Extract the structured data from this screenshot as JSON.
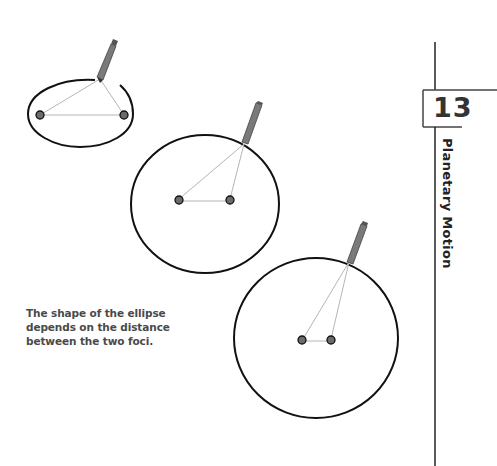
{
  "chapter": {
    "number": "13",
    "title": "Planetary Motion"
  },
  "caption": {
    "text": "The shape of the ellipse depends on the distance between the two foci."
  },
  "figure": {
    "ellipses": [
      {
        "cx": 80,
        "cy": 114,
        "rx": 53,
        "ry": 33,
        "foci": [
          [
            40,
            115
          ],
          [
            124,
            115
          ]
        ],
        "pencil_tip": [
          100,
          79
        ]
      },
      {
        "cx": 205,
        "cy": 200,
        "rx": 75,
        "ry": 70,
        "foci": [
          [
            179,
            199
          ],
          [
            230,
            199
          ]
        ],
        "pencil_tip": [
          244,
          144
        ]
      },
      {
        "cx": 317,
        "cy": 339,
        "rx": 82,
        "ry": 82,
        "foci": [
          [
            303,
            339
          ],
          [
            331,
            339
          ]
        ],
        "pencil_tip": [
          349,
          262
        ]
      }
    ],
    "colors": {
      "outline": "#111111",
      "string": "#b0b0b0",
      "focus_fill": "#6b6b6b",
      "pencil": "#7a7a7a"
    }
  }
}
